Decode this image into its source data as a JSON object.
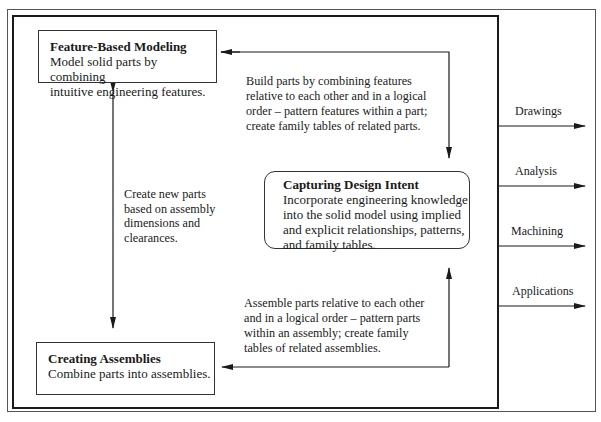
{
  "diagram": {
    "boxes": {
      "feature_based_modeling": {
        "title": "Feature-Based Modeling",
        "lines": [
          "Model solid parts by combining",
          "intuitive engineering features."
        ]
      },
      "capturing_design_intent": {
        "title": "Capturing Design Intent",
        "lines": [
          "Incorporate engineering knowledge",
          "into the solid model using implied",
          "and explicit relationships, patterns,",
          "and family tables."
        ]
      },
      "creating_assemblies": {
        "title": "Creating Assemblies",
        "lines": [
          "Combine parts into assemblies."
        ]
      }
    },
    "notes": {
      "build_parts": [
        "Build parts by combining features",
        "relative to each other and in a logical",
        "order – pattern features within a part;",
        "create family tables of related parts."
      ],
      "create_new_parts": [
        "Create new parts",
        "based on assembly",
        "dimensions and",
        "clearances."
      ],
      "assemble_parts": [
        "Assemble parts relative to each other",
        "and in a logical order – pattern parts",
        "within an assembly; create family",
        "tables of related assemblies."
      ]
    },
    "outputs": [
      "Drawings",
      "Analysis",
      "Machining",
      "Applications"
    ],
    "colors": {
      "line": "#1a1a1a",
      "frame": "#555555",
      "background": "#ffffff"
    }
  }
}
